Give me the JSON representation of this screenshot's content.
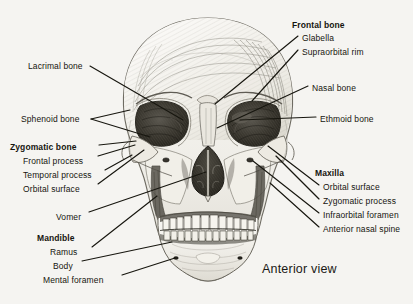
{
  "figure": {
    "title": "Anterior view",
    "background_color": "#f5f4f1",
    "ink_color": "#17160f"
  },
  "labels": {
    "left": [
      {
        "id": "lacrimal-bone",
        "text": "Lacrimal bone",
        "bold": false,
        "indent": false,
        "x": 28,
        "y": 62
      },
      {
        "id": "sphenoid-bone",
        "text": "Sphenoid bone",
        "bold": false,
        "indent": false,
        "x": 21,
        "y": 115
      },
      {
        "id": "zygomatic-bone",
        "text": "Zygomatic bone",
        "bold": true,
        "indent": false,
        "x": 10,
        "y": 143
      },
      {
        "id": "frontal-process",
        "text": "Frontal process",
        "bold": false,
        "indent": true,
        "x": 23,
        "y": 157
      },
      {
        "id": "temporal-process",
        "text": "Temporal process",
        "bold": false,
        "indent": true,
        "x": 23,
        "y": 171
      },
      {
        "id": "orbital-surface-zygomatic",
        "text": "Orbital surface",
        "bold": false,
        "indent": true,
        "x": 23,
        "y": 185
      },
      {
        "id": "vomer",
        "text": "Vomer",
        "bold": false,
        "indent": true,
        "x": 56,
        "y": 213
      },
      {
        "id": "mandible",
        "text": "Mandible",
        "bold": true,
        "indent": false,
        "x": 37,
        "y": 234
      },
      {
        "id": "ramus",
        "text": "Ramus",
        "bold": false,
        "indent": true,
        "x": 50,
        "y": 248
      },
      {
        "id": "body",
        "text": "Body",
        "bold": false,
        "indent": true,
        "x": 53,
        "y": 262
      },
      {
        "id": "mental-foramen",
        "text": "Mental foramen",
        "bold": false,
        "indent": true,
        "x": 43,
        "y": 276
      }
    ],
    "right": [
      {
        "id": "frontal-bone",
        "text": "Frontal bone",
        "bold": true,
        "indent": false,
        "x": 292,
        "y": 21
      },
      {
        "id": "glabella",
        "text": "Glabella",
        "bold": false,
        "indent": true,
        "x": 302,
        "y": 34
      },
      {
        "id": "supraorbital-rim",
        "text": "Supraorbital rim",
        "bold": false,
        "indent": true,
        "x": 302,
        "y": 48
      },
      {
        "id": "nasal-bone",
        "text": "Nasal bone",
        "bold": false,
        "indent": false,
        "x": 312,
        "y": 84
      },
      {
        "id": "ethmoid-bone",
        "text": "Ethmoid bone",
        "bold": false,
        "indent": false,
        "x": 320,
        "y": 115
      },
      {
        "id": "maxilla",
        "text": "Maxilla",
        "bold": true,
        "indent": false,
        "x": 315,
        "y": 169
      },
      {
        "id": "orbital-surface-maxilla",
        "text": "Orbital surface",
        "bold": false,
        "indent": true,
        "x": 323,
        "y": 183
      },
      {
        "id": "zygomatic-process",
        "text": "Zygomatic process",
        "bold": false,
        "indent": true,
        "x": 323,
        "y": 197
      },
      {
        "id": "infraorbital-foramen",
        "text": "Infraorbital foramen",
        "bold": false,
        "indent": true,
        "x": 323,
        "y": 211
      },
      {
        "id": "anterior-nasal-spine",
        "text": "Anterior nasal spine",
        "bold": false,
        "indent": true,
        "x": 323,
        "y": 225
      }
    ]
  },
  "view_caption": {
    "text": "Anterior view",
    "x": 262,
    "y": 265
  }
}
